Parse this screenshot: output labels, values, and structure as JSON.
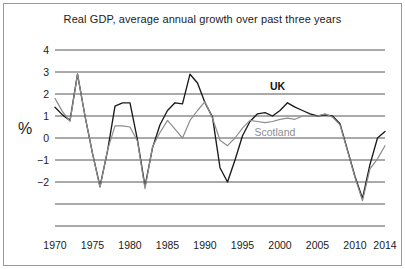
{
  "chart_data": {
    "type": "line",
    "title": "Real GDP, average annual growth over past three years",
    "xlabel": "",
    "ylabel": "%",
    "xlim": [
      1970,
      2014
    ],
    "ylim": [
      -4,
      4
    ],
    "grid": true,
    "legend_position": "inline-annotation",
    "x_ticks": [
      "1970",
      "1975",
      "1980",
      "1985",
      "1990",
      "1995",
      "2000",
      "2005",
      "2010",
      "2014"
    ],
    "x_tick_values": [
      1970,
      1975,
      1980,
      1985,
      1990,
      1995,
      2000,
      2005,
      2010,
      2014
    ],
    "y_ticks": [
      "4",
      "3",
      "2",
      "1",
      "0",
      "−1",
      "−2"
    ],
    "y_tick_values": [
      4,
      3,
      2,
      1,
      0,
      -1,
      -2
    ],
    "gridline_values": [
      4,
      3,
      2,
      1,
      0,
      -1,
      -2,
      -3,
      -4
    ],
    "x": [
      1970,
      1971,
      1972,
      1973,
      1974,
      1975,
      1976,
      1977,
      1978,
      1979,
      1980,
      1981,
      1982,
      1983,
      1984,
      1985,
      1986,
      1987,
      1988,
      1989,
      1990,
      1991,
      1992,
      1993,
      1994,
      1995,
      1996,
      1997,
      1998,
      1999,
      2000,
      2001,
      2002,
      2003,
      2004,
      2005,
      2006,
      2007,
      2008,
      2009,
      2010,
      2011,
      2012,
      2013,
      2014
    ],
    "series": [
      {
        "name": "UK",
        "color": "#1a1a1a",
        "values": [
          1.4,
          1.05,
          0.8,
          2.9,
          1.0,
          -0.7,
          -2.2,
          -0.6,
          1.45,
          1.6,
          1.6,
          -0.1,
          -2.2,
          -0.45,
          0.6,
          1.25,
          1.6,
          1.55,
          2.9,
          2.5,
          1.6,
          0.95,
          -1.35,
          -2.0,
          -1.0,
          0.1,
          0.75,
          1.1,
          1.15,
          1.0,
          1.25,
          1.6,
          1.4,
          1.25,
          1.1,
          1.0,
          1.05,
          1.0,
          0.65,
          -0.55,
          -1.75,
          -2.75,
          -1.2,
          0.0,
          0.3
        ],
        "label_position": {
          "x_value": 2000,
          "y_value": 2.3
        }
      },
      {
        "name": "Scotland",
        "color": "#8d8d8d",
        "values": [
          1.8,
          1.2,
          0.75,
          2.9,
          1.0,
          -0.7,
          -2.25,
          -0.55,
          0.55,
          0.55,
          0.5,
          -0.15,
          -2.3,
          -0.4,
          0.25,
          0.8,
          0.4,
          0.0,
          0.8,
          1.25,
          1.65,
          0.9,
          -0.1,
          -0.35,
          0.0,
          0.45,
          0.8,
          0.75,
          0.7,
          0.75,
          0.85,
          0.9,
          0.85,
          1.0,
          1.0,
          1.0,
          1.1,
          0.95,
          0.6,
          -0.6,
          -1.8,
          -2.85,
          -1.4,
          -0.95,
          -0.35
        ],
        "label_position": {
          "x_value": 1999,
          "y_value": 0.25
        }
      }
    ]
  }
}
